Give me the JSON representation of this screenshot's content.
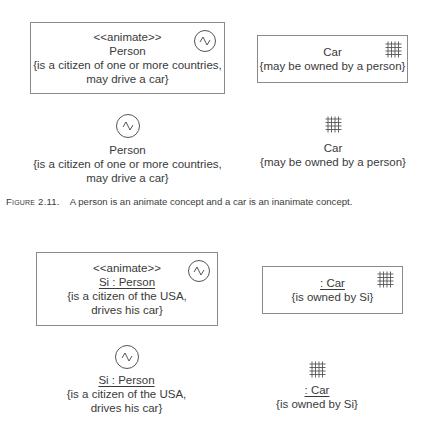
{
  "figure_2_11": {
    "person_box": {
      "stereotype": "<<animate>>",
      "name": "Person",
      "note_line1": "{is a citizen of one or more countries,",
      "note_line2": "may drive a car}",
      "icon": "animate-icon"
    },
    "car_box": {
      "name": "Car",
      "note_line1": "{may be owned by a person}",
      "icon": "inanimate-grid-icon"
    },
    "person_icon_form": {
      "name": "Person",
      "note_line1": "{is a citizen of one or more countries,",
      "note_line2": "may drive a car}",
      "icon": "animate-icon"
    },
    "car_icon_form": {
      "name": "Car",
      "note_line1": "{may be owned by a person}",
      "icon": "inanimate-grid-icon"
    },
    "caption": {
      "label": "Figure 2.11.",
      "text": "A person is an animate concept and a car is an inanimate concept."
    }
  },
  "figure_2_12": {
    "person_box": {
      "stereotype": "<<animate>>",
      "name": "Si : Person",
      "note_line1": "{is a citizen of the USA,",
      "note_line2": "drives his car}",
      "icon": "animate-icon"
    },
    "car_box": {
      "name": ": Car",
      "note_line1": "{is owned by Si}",
      "icon": "inanimate-grid-icon"
    },
    "person_icon_form": {
      "name": "Si : Person",
      "note_line1": "{is a citizen of the USA,",
      "note_line2": "drives his car}",
      "icon": "animate-icon"
    },
    "car_icon_form": {
      "name": ": Car",
      "note_line1": "{is owned by Si}",
      "icon": "inanimate-grid-icon"
    }
  },
  "colors": {
    "text": "#3a3a3a",
    "border": "#8a8a8a",
    "icon_stroke": "#555555",
    "background": "#ffffff"
  }
}
